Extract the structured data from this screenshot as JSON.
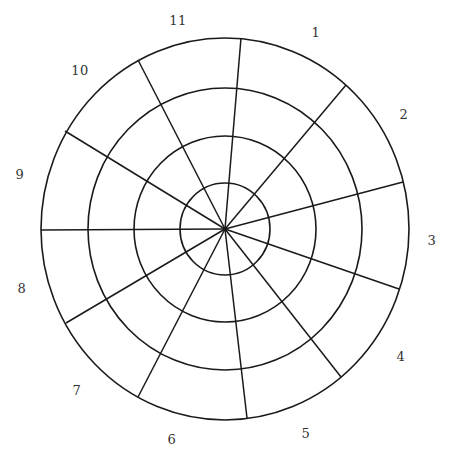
{
  "diagram": {
    "type": "polar-grid-wheel",
    "center": {
      "x": 225,
      "y": 229
    },
    "rings": [
      {
        "name": "ring-1",
        "rx": 45,
        "ry": 46
      },
      {
        "name": "ring-2",
        "rx": 91,
        "ry": 93
      },
      {
        "name": "ring-3",
        "rx": 137,
        "ry": 141
      },
      {
        "name": "ring-outer",
        "rx": 184,
        "ry": 191
      }
    ],
    "spokes": [
      {
        "x2": 241,
        "y2": 38
      },
      {
        "x2": 346,
        "y2": 85
      },
      {
        "x2": 403,
        "y2": 182
      },
      {
        "x2": 399,
        "y2": 289
      },
      {
        "x2": 341,
        "y2": 377
      },
      {
        "x2": 247,
        "y2": 418
      },
      {
        "x2": 138,
        "y2": 397
      },
      {
        "x2": 66,
        "y2": 323
      },
      {
        "x2": 41,
        "y2": 230
      },
      {
        "x2": 65,
        "y2": 131
      },
      {
        "x2": 138,
        "y2": 60
      }
    ],
    "labels": [
      {
        "text": "1",
        "x": 316,
        "y": 32
      },
      {
        "text": "2",
        "x": 404,
        "y": 114
      },
      {
        "text": "3",
        "x": 432,
        "y": 240
      },
      {
        "text": "4",
        "x": 401,
        "y": 356
      },
      {
        "text": "5",
        "x": 306,
        "y": 433
      },
      {
        "text": "6",
        "x": 172,
        "y": 439
      },
      {
        "text": "7",
        "x": 77,
        "y": 390
      },
      {
        "text": "8",
        "x": 22,
        "y": 288
      },
      {
        "text": "9",
        "x": 20,
        "y": 174
      },
      {
        "text": "10",
        "x": 80,
        "y": 70
      },
      {
        "text": "11",
        "x": 178,
        "y": 20
      }
    ],
    "colors": {
      "line": "#1a1a1a",
      "label": "#333333",
      "background": "#ffffff"
    }
  }
}
